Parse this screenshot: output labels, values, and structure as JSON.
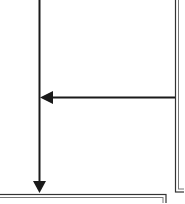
{
  "diagram": {
    "type": "flowchart-fragment",
    "colors": {
      "line": "#1a1a1a",
      "background": "#ffffff",
      "border_light": "#9a9a9a"
    },
    "nodes": [
      {
        "id": "right-box",
        "label": "",
        "style": "double-border",
        "visible_region": "right edge, partially cropped"
      },
      {
        "id": "bottom-box",
        "label": "",
        "style": "double-border",
        "visible_region": "bottom edge, partially cropped"
      }
    ],
    "edges": [
      {
        "from": "top",
        "to": "bottom-box",
        "direction": "down",
        "arrowhead": "filled-triangle"
      },
      {
        "from": "right-box",
        "to": "vertical-line",
        "direction": "left",
        "arrowhead": "filled-triangle"
      }
    ]
  }
}
